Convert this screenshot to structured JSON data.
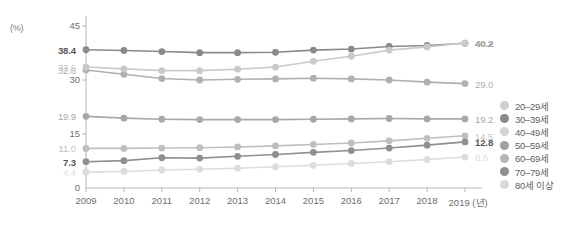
{
  "chart_data": {
    "type": "line",
    "title": "",
    "subtitle": "",
    "xlabel": "(년)",
    "ylabel": "(%)",
    "unit_label": "(%)",
    "x_axis_suffix": "(년)",
    "categories": [
      "2009",
      "2010",
      "2011",
      "2012",
      "2013",
      "2014",
      "2015",
      "2016",
      "2017",
      "2018",
      "2019"
    ],
    "x": [
      2009,
      2010,
      2011,
      2012,
      2013,
      2014,
      2015,
      2016,
      2017,
      2018,
      2019
    ],
    "ylim": [
      0,
      45
    ],
    "yticks": [
      "0",
      "15",
      "30",
      "45"
    ],
    "ytick_values": [
      0,
      15,
      30,
      45
    ],
    "grid": false,
    "legend_position": "right",
    "series": [
      {
        "name": "20–29세",
        "color": "#b0b0b0",
        "values": [
          32.8,
          31.6,
          30.4,
          30.0,
          30.2,
          30.3,
          30.5,
          30.3,
          30.0,
          29.4,
          29.0
        ],
        "start_label": "32.8",
        "end_label": "29.0",
        "start_label_bold": false,
        "end_label_bold": false
      },
      {
        "name": "30–39세",
        "color": "#8a8a8a",
        "values": [
          38.4,
          38.2,
          37.9,
          37.6,
          37.6,
          37.7,
          38.3,
          38.6,
          39.3,
          39.6,
          40.2
        ],
        "start_label": "38.4",
        "end_label": "40.2",
        "start_label_bold": true,
        "end_label_bold": true
      },
      {
        "name": "40–49세",
        "color": "#c9c9c9",
        "values": [
          33.6,
          33.1,
          32.6,
          32.6,
          33.0,
          33.6,
          35.2,
          36.6,
          38.3,
          39.2,
          40.3
        ],
        "start_label": "33.6",
        "end_label": "40.3",
        "start_label_bold": false,
        "end_label_bold": false
      },
      {
        "name": "50–59세",
        "color": "#a8a8a8",
        "values": [
          19.9,
          19.4,
          19.1,
          19.0,
          19.0,
          19.0,
          19.1,
          19.2,
          19.3,
          19.2,
          19.2
        ],
        "start_label": "19.9",
        "end_label": "19.2",
        "start_label_bold": false,
        "end_label_bold": false
      },
      {
        "name": "60–69세",
        "color": "#bfbfbf",
        "values": [
          11.0,
          11.0,
          11.1,
          11.2,
          11.4,
          11.7,
          12.1,
          12.5,
          13.1,
          13.8,
          14.5
        ],
        "start_label": "11.0",
        "end_label": "14.5",
        "start_label_bold": false,
        "end_label_bold": false
      },
      {
        "name": "70–79세",
        "color": "#8f8f8f",
        "values": [
          7.3,
          7.6,
          8.4,
          8.3,
          8.8,
          9.3,
          9.9,
          10.4,
          11.1,
          11.9,
          12.8
        ],
        "start_label": "7.3",
        "end_label": "12.8",
        "start_label_bold": true,
        "end_label_bold": true
      },
      {
        "name": "80세 이상",
        "color": "#dcdcdc",
        "values": [
          4.4,
          4.6,
          5.0,
          5.2,
          5.5,
          5.9,
          6.3,
          6.8,
          7.3,
          7.9,
          8.6
        ],
        "start_label": "4.4",
        "end_label": "8.6",
        "start_label_bold": false,
        "end_label_bold": false
      }
    ],
    "legend": [
      {
        "label": "20–29세",
        "color": "#cfcfcf"
      },
      {
        "label": "30–39세",
        "color": "#8a8a8a"
      },
      {
        "label": "40–49세",
        "color": "#d4d4d4"
      },
      {
        "label": "50–59세",
        "color": "#a0a0a0"
      },
      {
        "label": "60–69세",
        "color": "#b6b6b6"
      },
      {
        "label": "70–79세",
        "color": "#8f8f8f"
      },
      {
        "label": "80세 이상",
        "color": "#d9d9d9"
      }
    ],
    "axis_color": "#b5b5b5",
    "label_color": "#6e6e6e"
  }
}
